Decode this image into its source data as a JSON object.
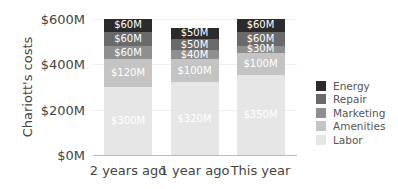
{
  "chart_data": {
    "type": "bar",
    "stacked": true,
    "title": "",
    "xlabel": "",
    "ylabel": "Chariott's costs",
    "ylim": [
      0,
      600
    ],
    "yticks": [
      "$0M",
      "$200M",
      "$400M",
      "$600M"
    ],
    "categories": [
      "2 years ago",
      "1 year ago",
      "This year"
    ],
    "series": [
      {
        "name": "Labor",
        "color": "#e6e6e6",
        "values": [
          300,
          320,
          350
        ],
        "labels": [
          "$300M",
          "$320M",
          "$350M"
        ]
      },
      {
        "name": "Amenities",
        "color": "#c4c4c4",
        "values": [
          120,
          100,
          100
        ],
        "labels": [
          "$120M",
          "$100M",
          "$100M"
        ]
      },
      {
        "name": "Marketing",
        "color": "#8f8f8f",
        "values": [
          60,
          40,
          30
        ],
        "labels": [
          "$60M",
          "$40M",
          "$30M"
        ]
      },
      {
        "name": "Repair",
        "color": "#6a6a6a",
        "values": [
          60,
          50,
          60
        ],
        "labels": [
          "$60M",
          "$50M",
          "$60M"
        ]
      },
      {
        "name": "Energy",
        "color": "#2b2b2b",
        "values": [
          60,
          50,
          60
        ],
        "labels": [
          "$60M",
          "$50M",
          "$60M"
        ]
      }
    ],
    "legend": {
      "position": "right",
      "entries": [
        "Energy",
        "Repair",
        "Marketing",
        "Amenities",
        "Labor"
      ]
    },
    "grid": true
  }
}
